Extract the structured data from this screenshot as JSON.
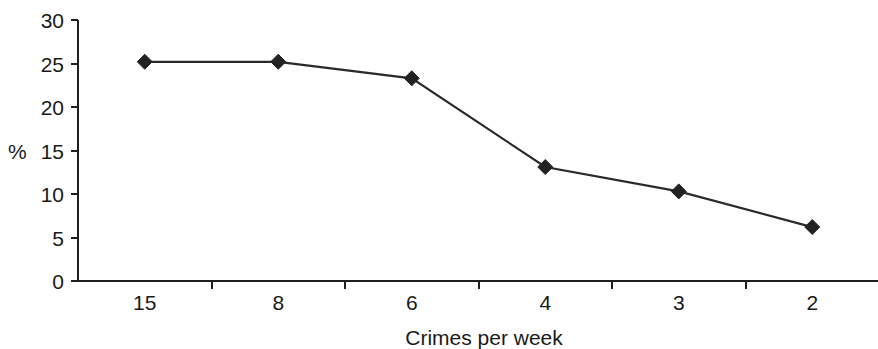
{
  "chart_data": {
    "type": "line",
    "title": "",
    "xlabel": "Crimes per week",
    "ylabel": "%",
    "categories": [
      "15",
      "8",
      "6",
      "4",
      "3",
      "2"
    ],
    "values": [
      25.2,
      25.2,
      23.3,
      13.1,
      10.3,
      6.2
    ],
    "series": [
      {
        "name": "",
        "values": [
          25.2,
          25.2,
          23.3,
          13.1,
          10.3,
          6.2
        ]
      }
    ],
    "ylim": [
      0,
      30
    ],
    "yticks": [
      0,
      5,
      10,
      15,
      20,
      25,
      30
    ],
    "ytick_labels": [
      "0",
      "5",
      "10",
      "15",
      "20",
      "25",
      "30"
    ],
    "grid": false,
    "legend": false,
    "marker": "diamond",
    "line_color": "#2a2a2a",
    "marker_color": "#222222",
    "axis_color": "#1f1f1f",
    "background": "#ffffff"
  }
}
